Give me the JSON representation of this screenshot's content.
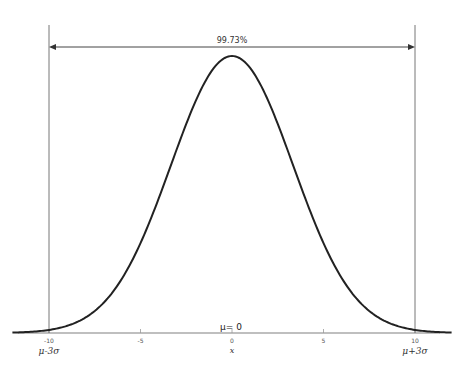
{
  "chart_data": {
    "type": "line",
    "title": "",
    "xlabel": "x",
    "ylabel": "",
    "distribution": "normal",
    "mean": 0,
    "sigma": 3.333,
    "x_range": [
      -12,
      12
    ],
    "xlim": [
      -12,
      12
    ],
    "xticks": [
      -10,
      -5,
      0,
      5,
      10
    ],
    "xtick_labels": [
      "-10",
      "-5",
      "0",
      "5",
      "10"
    ],
    "grid": false,
    "legend": null,
    "series": [
      {
        "name": "normal pdf",
        "color": "#222222"
      }
    ],
    "annotations": {
      "span_label": "99.73%",
      "span_from": -10,
      "span_to": 10,
      "lower_bound_label": "μ-3σ",
      "upper_bound_label": "μ+3σ",
      "mean_label": "μ= 0"
    }
  }
}
